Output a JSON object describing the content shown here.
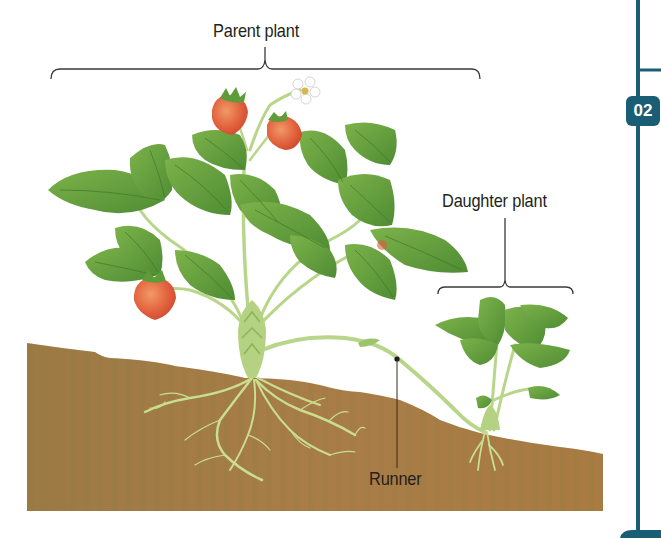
{
  "labels": {
    "parent_plant": "Parent plant",
    "daughter_plant": "Daughter plant",
    "runner": "Runner"
  },
  "section_marker": {
    "number": "02",
    "color": "#1a5e75"
  },
  "colors": {
    "soil": "#a57a45",
    "soil_dark": "#8f6a3a",
    "leaf": "#5e9c3a",
    "leaf_light": "#8cbf56",
    "stem": "#b8d68a",
    "root": "#c9de8e",
    "strawberry": "#e0583a",
    "flower": "#ffffff",
    "bracket": "#3a3a3a"
  },
  "diagram": {
    "parts": [
      "Parent plant",
      "Daughter plant",
      "Runner"
    ]
  }
}
